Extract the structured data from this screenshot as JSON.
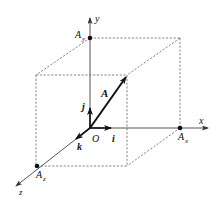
{
  "diagram": {
    "type": "3d-vector-decomposition",
    "axes": {
      "x": {
        "label": "x"
      },
      "y": {
        "label": "y"
      },
      "z": {
        "label": "z"
      }
    },
    "origin": {
      "label": "O"
    },
    "unit_vectors": {
      "i": {
        "label": "i"
      },
      "j": {
        "label": "j"
      },
      "k": {
        "label": "k"
      }
    },
    "vector": {
      "label": "A"
    },
    "components": {
      "Ax": {
        "base": "A",
        "sub": "x"
      },
      "Ay": {
        "base": "A",
        "sub": "y"
      },
      "Az": {
        "base": "A",
        "sub": "z"
      }
    },
    "colors": {
      "line": "#111111",
      "dashed": "#777777",
      "axis": "#555555",
      "background": "#ffffff"
    }
  }
}
